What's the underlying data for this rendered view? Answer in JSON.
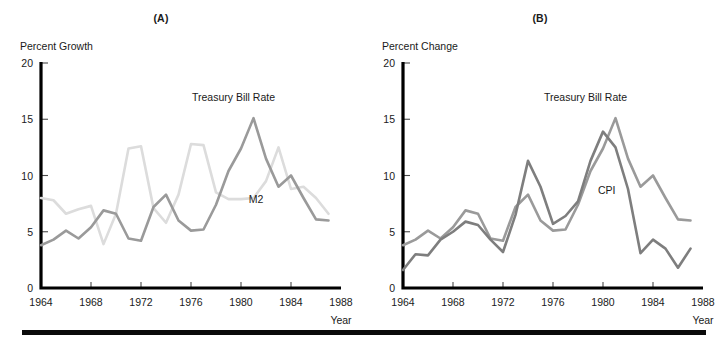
{
  "figure": {
    "bottom_rule_color": "#0a0a0a"
  },
  "panels": [
    {
      "id": "A",
      "title": "(A)",
      "y_axis_title": "Percent Growth",
      "x_axis_title": "Year"
    },
    {
      "id": "B",
      "title": "(B)",
      "y_axis_title": "Percent Change",
      "x_axis_title": "Year"
    }
  ],
  "chart_data": [
    {
      "type": "line",
      "title": "(A)",
      "xlabel": "Year",
      "ylabel": "Percent Growth",
      "xlim": [
        1964,
        1988
      ],
      "ylim": [
        0,
        20
      ],
      "yticks": [
        0,
        5,
        10,
        15,
        20
      ],
      "xticks": [
        1964,
        1968,
        1972,
        1976,
        1980,
        1984,
        1988
      ],
      "grid": false,
      "legend": "inline-annotations",
      "series": [
        {
          "name": "Treasury Bill Rate",
          "color": "#9a9a9a",
          "label_x": 1979.4,
          "label_y": 16.6,
          "x": [
            1964,
            1965,
            1966,
            1967,
            1968,
            1969,
            1970,
            1971,
            1972,
            1973,
            1974,
            1975,
            1976,
            1977,
            1978,
            1979,
            1980,
            1981,
            1982,
            1983,
            1984,
            1985,
            1986,
            1987
          ],
          "values": [
            3.8,
            4.3,
            5.1,
            4.4,
            5.4,
            6.9,
            6.6,
            4.4,
            4.2,
            7.2,
            8.3,
            6.0,
            5.1,
            5.2,
            7.4,
            10.4,
            12.4,
            15.1,
            11.5,
            9.0,
            10.0,
            8.0,
            6.1,
            6.0
          ]
        },
        {
          "name": "M2",
          "color": "#dcdcdc",
          "label_x": 1981.2,
          "label_y": 7.6,
          "x": [
            1964,
            1965,
            1966,
            1967,
            1968,
            1969,
            1970,
            1971,
            1972,
            1973,
            1974,
            1975,
            1976,
            1977,
            1978,
            1979,
            1980,
            1981,
            1982,
            1983,
            1984,
            1985,
            1986,
            1987
          ],
          "values": [
            8.0,
            7.8,
            6.6,
            7.0,
            7.3,
            3.9,
            6.6,
            12.4,
            12.6,
            7.1,
            5.8,
            8.3,
            12.8,
            12.7,
            8.5,
            7.9,
            7.9,
            8.0,
            9.5,
            12.5,
            8.8,
            9.0,
            8.0,
            6.6
          ]
        }
      ]
    },
    {
      "type": "line",
      "title": "(B)",
      "xlabel": "Year",
      "ylabel": "Percent Change",
      "xlim": [
        1964,
        1988
      ],
      "ylim": [
        0,
        20
      ],
      "yticks": [
        0,
        5,
        10,
        15,
        20
      ],
      "xticks": [
        1964,
        1968,
        1972,
        1976,
        1980,
        1984,
        1988
      ],
      "grid": false,
      "legend": "inline-annotations",
      "series": [
        {
          "name": "Treasury Bill Rate",
          "color": "#9a9a9a",
          "label_x": 1978.6,
          "label_y": 16.6,
          "x": [
            1964,
            1965,
            1966,
            1967,
            1968,
            1969,
            1970,
            1971,
            1972,
            1973,
            1974,
            1975,
            1976,
            1977,
            1978,
            1979,
            1980,
            1981,
            1982,
            1983,
            1984,
            1985,
            1986,
            1987
          ],
          "values": [
            3.8,
            4.3,
            5.1,
            4.4,
            5.4,
            6.9,
            6.6,
            4.4,
            4.2,
            7.2,
            8.3,
            6.0,
            5.1,
            5.2,
            7.4,
            10.4,
            12.4,
            15.1,
            11.5,
            9.0,
            10.0,
            8.0,
            6.1,
            6.0
          ]
        },
        {
          "name": "CPI",
          "color": "#7e7e7e",
          "label_x": 1980.3,
          "label_y": 8.4,
          "x": [
            1964,
            1965,
            1966,
            1967,
            1968,
            1969,
            1970,
            1971,
            1972,
            1973,
            1974,
            1975,
            1976,
            1977,
            1978,
            1979,
            1980,
            1981,
            1982,
            1983,
            1984,
            1985,
            1986,
            1987
          ],
          "values": [
            1.6,
            3.0,
            2.9,
            4.3,
            5.0,
            5.9,
            5.6,
            4.3,
            3.2,
            6.5,
            11.3,
            9.0,
            5.7,
            6.4,
            7.7,
            11.3,
            13.9,
            12.5,
            8.8,
            3.1,
            4.3,
            3.5,
            1.8,
            3.5
          ]
        }
      ]
    }
  ]
}
